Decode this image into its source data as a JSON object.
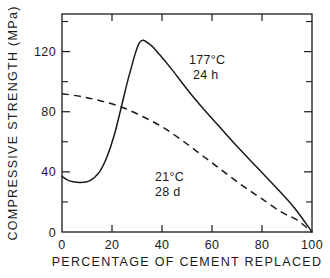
{
  "chart_data": {
    "type": "line",
    "title": "",
    "xlabel": "PERCENTAGE OF CEMENT REPLACED",
    "ylabel": "COMPRESSIVE STRENGTH  (MPa)",
    "xlim": [
      0,
      100
    ],
    "ylim": [
      0,
      145
    ],
    "grid": false,
    "legend_position": "inline-annotations",
    "x_ticks_major": [
      0,
      20,
      40,
      60,
      80,
      100
    ],
    "x_tick_labels": [
      "0",
      "20",
      "40",
      "60",
      "80",
      "100"
    ],
    "y_ticks_major": [
      0,
      40,
      80,
      120
    ],
    "y_tick_labels": [
      "0",
      "40",
      "80",
      "120"
    ],
    "y_ticks_minor": [
      20,
      60,
      100,
      140
    ],
    "series": [
      {
        "name": "177°C 24 h",
        "style": "solid",
        "label_line1": "177°C",
        "label_line2": "24 h",
        "x": [
          0,
          3,
          7,
          11,
          15,
          18,
          21,
          24,
          27,
          31,
          35,
          39,
          44,
          50,
          56,
          63,
          70,
          78,
          86,
          93,
          100
        ],
        "y": [
          37,
          34,
          33,
          34,
          40,
          50,
          65,
          85,
          105,
          126,
          125,
          118,
          108,
          95,
          83,
          70,
          57,
          43,
          29,
          16,
          0
        ]
      },
      {
        "name": "21°C 28 d",
        "style": "dashed",
        "label_line1": "21°C",
        "label_line2": "28 d",
        "x": [
          0,
          8,
          16,
          24,
          32,
          40,
          48,
          56,
          64,
          72,
          80,
          88,
          94,
          100
        ],
        "y": [
          92,
          90,
          87,
          83,
          77,
          70,
          61,
          51,
          41,
          31,
          22,
          13,
          8,
          0
        ]
      }
    ],
    "annotations": [
      {
        "text_line1": "177°C",
        "text_line2": "24 h",
        "x": 48,
        "y": 104
      },
      {
        "text_line1": "21°C",
        "text_line2": "28 d",
        "x": 36,
        "y": 44
      }
    ]
  },
  "colors": {
    "ink": "#1a1a1a",
    "background": "#ffffff"
  }
}
